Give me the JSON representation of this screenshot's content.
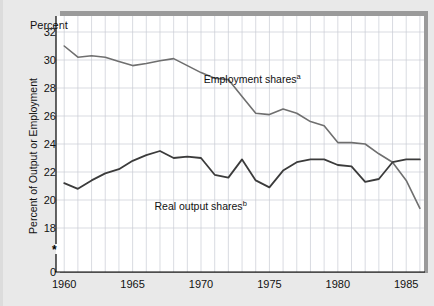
{
  "figure": {
    "percent_caption": "Percent",
    "y_axis_title": "Percent of Output or Employment",
    "axis_break_marker": "*"
  },
  "chart_data": {
    "type": "line",
    "title": "",
    "xlabel": "",
    "ylabel": "Percent of Output or Employment",
    "percent_caption": "Percent",
    "xlim": [
      1959.4,
      1986.3
    ],
    "ylim": [
      17.0,
      33.0
    ],
    "yticks": [
      18,
      20,
      22,
      24,
      26,
      28,
      30,
      32
    ],
    "ytick_labels": [
      "18",
      "20",
      "22",
      "24",
      "26",
      "28",
      "30",
      "32"
    ],
    "y_zero_label": "0",
    "y_axis_broken": true,
    "xticks": [
      1960,
      1965,
      1970,
      1975,
      1980,
      1985
    ],
    "xtick_labels": [
      "1960",
      "1965",
      "1970",
      "1975",
      "1980",
      "1985"
    ],
    "x_minor_gridlines": true,
    "grid": true,
    "grid_color": "#c9cbd4",
    "legend_position": "inline-annotation",
    "x": [
      1960,
      1961,
      1962,
      1963,
      1964,
      1965,
      1966,
      1967,
      1968,
      1969,
      1970,
      1971,
      1972,
      1973,
      1974,
      1975,
      1976,
      1977,
      1978,
      1979,
      1980,
      1981,
      1982,
      1983,
      1984,
      1985,
      1986
    ],
    "series": [
      {
        "name": "Employment shares",
        "footnote": "a",
        "label": "Employment shares",
        "color": "#6f6f6f",
        "line_width": 1.6,
        "annotation": {
          "text": "Employment shares",
          "sup": "a",
          "x": 1970.2,
          "y": 28.6
        },
        "values": [
          31.0,
          30.2,
          30.3,
          30.2,
          29.9,
          29.6,
          29.75,
          29.95,
          30.1,
          29.6,
          29.1,
          28.7,
          28.6,
          27.4,
          26.2,
          26.1,
          26.5,
          26.2,
          25.6,
          25.3,
          24.1,
          24.1,
          24.0,
          23.3,
          22.7,
          21.4,
          19.4
        ]
      },
      {
        "name": "Real output shares",
        "footnote": "b",
        "label": "Real output shares",
        "color": "#3b3b3b",
        "line_width": 1.8,
        "annotation": {
          "text": "Real output shares",
          "sup": "b",
          "x": 1966.6,
          "y": 19.5
        },
        "values": [
          21.2,
          20.8,
          21.4,
          21.9,
          22.2,
          22.8,
          23.2,
          23.5,
          23.0,
          23.1,
          23.0,
          21.8,
          21.6,
          22.9,
          21.4,
          20.9,
          22.1,
          22.7,
          22.9,
          22.9,
          22.5,
          22.4,
          21.3,
          21.5,
          22.7,
          22.9,
          22.9
        ]
      }
    ],
    "annotations": [
      {
        "name": "employment-shares-label",
        "text": "Employment shares",
        "sup": "a"
      },
      {
        "name": "real-output-shares-label",
        "text": "Real output shares",
        "sup": "b"
      }
    ]
  }
}
